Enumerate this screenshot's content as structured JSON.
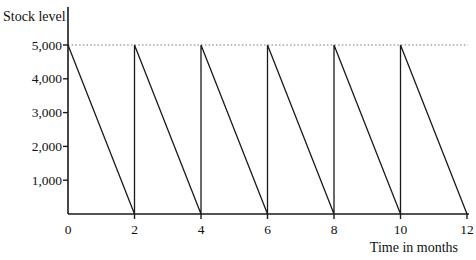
{
  "chart_data": {
    "type": "line",
    "title": "",
    "ylabel": "Stock level",
    "xlabel": "Time in months",
    "xlim": [
      0,
      12
    ],
    "ylim": [
      0,
      5000
    ],
    "x_ticks": [
      {
        "value": 0,
        "label": "0"
      },
      {
        "value": 2,
        "label": "2"
      },
      {
        "value": 4,
        "label": "4"
      },
      {
        "value": 6,
        "label": "6"
      },
      {
        "value": 8,
        "label": "8"
      },
      {
        "value": 10,
        "label": "10"
      },
      {
        "value": 12,
        "label": "12"
      }
    ],
    "y_ticks": [
      {
        "value": 1000,
        "label": "1,000"
      },
      {
        "value": 2000,
        "label": "2,000"
      },
      {
        "value": 3000,
        "label": "3,000"
      },
      {
        "value": 4000,
        "label": "4,000"
      },
      {
        "value": 5000,
        "label": "5,000"
      }
    ],
    "grid": false,
    "legend": false,
    "axis_color": "#1a1a1a",
    "reference_line": {
      "y": 5000,
      "style": "dotted",
      "color": "#777777"
    },
    "series": [
      {
        "name": "stock-level-sawtooth",
        "color": "#1a1a1a",
        "points": [
          [
            0,
            5000
          ],
          [
            2,
            0
          ],
          [
            2,
            5000
          ],
          [
            4,
            0
          ],
          [
            4,
            5000
          ],
          [
            6,
            0
          ],
          [
            6,
            5000
          ],
          [
            8,
            0
          ],
          [
            8,
            5000
          ],
          [
            10,
            0
          ],
          [
            10,
            5000
          ],
          [
            12,
            0
          ]
        ]
      }
    ]
  }
}
